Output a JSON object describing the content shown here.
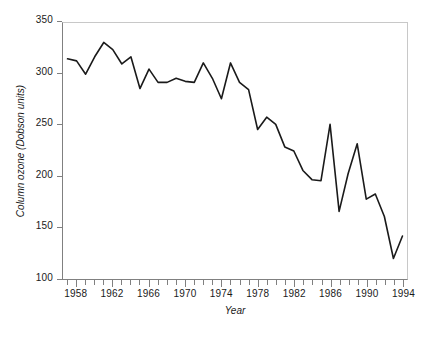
{
  "chart_data": {
    "type": "line",
    "title": "",
    "xlabel": "Year",
    "ylabel": "Column ozone (Dobson units)",
    "xlim": [
      1956.5,
      1994.5
    ],
    "ylim": [
      100,
      350
    ],
    "ytick_labels": [
      "100",
      "150",
      "200",
      "250",
      "300",
      "350"
    ],
    "yticks": [
      100,
      150,
      200,
      250,
      300,
      350
    ],
    "xtick_labels": [
      "1958",
      "1962",
      "1966",
      "1970",
      "1974",
      "1978",
      "1982",
      "1986",
      "1990",
      "1994"
    ],
    "xticks_major": [
      1958,
      1962,
      1966,
      1970,
      1974,
      1978,
      1982,
      1986,
      1990,
      1994
    ],
    "xticks_minor_step": 1,
    "grid": false,
    "legend": false,
    "series": [
      {
        "name": "Column ozone",
        "color": "#1a1a1a",
        "x": [
          1957,
          1958,
          1959,
          1960,
          1961,
          1962,
          1963,
          1964,
          1965,
          1966,
          1967,
          1968,
          1969,
          1970,
          1971,
          1972,
          1973,
          1974,
          1975,
          1976,
          1977,
          1978,
          1979,
          1980,
          1981,
          1982,
          1983,
          1984,
          1985,
          1986,
          1987,
          1988,
          1989,
          1990,
          1991,
          1992,
          1993,
          1994
        ],
        "values": [
          315,
          313,
          300,
          317,
          331,
          324,
          310,
          317,
          286,
          305,
          292,
          292,
          296,
          293,
          292,
          311,
          296,
          276,
          311,
          292,
          285,
          246,
          258,
          251,
          229,
          225,
          206,
          197,
          196,
          251,
          166,
          203,
          232,
          178,
          183,
          161,
          120,
          142
        ]
      }
    ]
  },
  "axes": {
    "y_title": "Column ozone (Dobson units)",
    "x_title": "Year"
  },
  "colors": {
    "line": "#1a1a1a",
    "axis": "#808080",
    "frame_light": "#c8c8c8",
    "background": "#ffffff"
  }
}
